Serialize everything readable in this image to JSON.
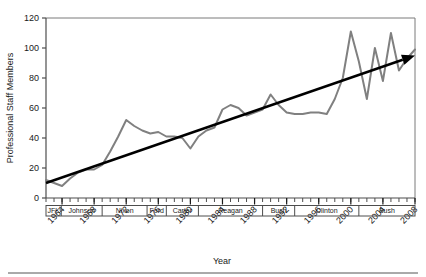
{
  "chart_data": {
    "type": "line",
    "title": "",
    "xlabel": "Year",
    "ylabel": "Professional Staff Members",
    "xlim": [
      1962,
      2008
    ],
    "ylim": [
      0,
      120
    ],
    "yticks": [
      0,
      20,
      40,
      60,
      80,
      100,
      120
    ],
    "xticks": [
      1964,
      1968,
      1972,
      1976,
      1980,
      1984,
      1988,
      1992,
      1996,
      2000,
      2004,
      2008
    ],
    "xtick_minor_step": 1,
    "grid": false,
    "legend": false,
    "series": [
      {
        "name": "Professional Staff Members",
        "color": "#808080",
        "x": [
          1962,
          1963,
          1964,
          1965,
          1966,
          1967,
          1968,
          1969,
          1970,
          1971,
          1972,
          1973,
          1974,
          1975,
          1976,
          1977,
          1978,
          1979,
          1980,
          1981,
          1982,
          1983,
          1984,
          1985,
          1986,
          1987,
          1988,
          1989,
          1990,
          1991,
          1992,
          1993,
          1994,
          1995,
          1996,
          1997,
          1998,
          1999,
          2000,
          2001,
          2002,
          2003,
          2004,
          2005,
          2006,
          2007,
          2008
        ],
        "y": [
          12,
          10,
          8,
          13,
          17,
          19,
          19,
          22,
          31,
          41,
          52,
          48,
          45,
          43,
          44,
          41,
          41,
          40,
          33,
          41,
          45,
          47,
          59,
          62,
          60,
          55,
          57,
          59,
          69,
          62,
          57,
          56,
          56,
          57,
          57,
          56,
          66,
          80,
          111,
          91,
          66,
          100,
          78,
          110,
          85,
          93,
          99
        ]
      }
    ],
    "trendline": {
      "name": "trend-arrow",
      "color": "#000000",
      "x_start": 1962,
      "y_start": 10,
      "x_end": 2008,
      "y_end": 95,
      "arrow": true
    },
    "president_bands": [
      {
        "label": "JFK",
        "start": 1962,
        "end": 1963.9
      },
      {
        "label": "Johnson",
        "start": 1963.9,
        "end": 1969
      },
      {
        "label": "Nixon",
        "start": 1969,
        "end": 1974.6
      },
      {
        "label": "Ford",
        "start": 1974.6,
        "end": 1977
      },
      {
        "label": "Carter",
        "start": 1977,
        "end": 1981
      },
      {
        "label": "Reagan",
        "start": 1981,
        "end": 1989
      },
      {
        "label": "Bush",
        "start": 1989,
        "end": 1993
      },
      {
        "label": "Clinton",
        "start": 1993,
        "end": 2001
      },
      {
        "label": "Bush",
        "start": 2001,
        "end": 2008
      }
    ]
  }
}
